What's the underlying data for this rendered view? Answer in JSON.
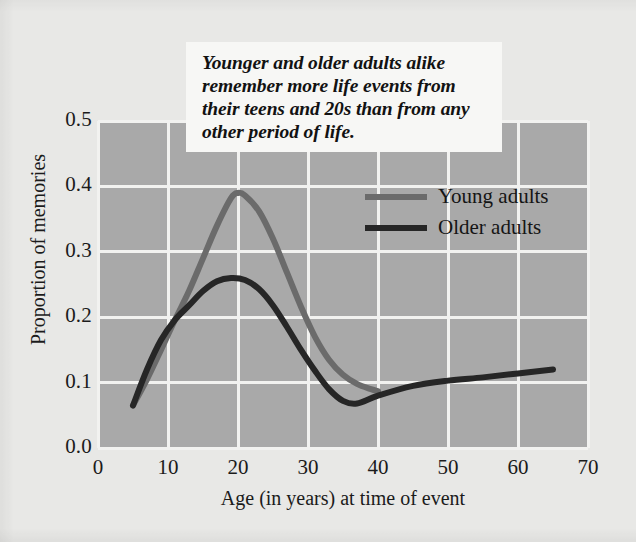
{
  "caption": {
    "text": "Younger and older adults alike remember more life events from their teens and 20s than from any other period of life."
  },
  "colors": {
    "background": "#e8e8e6",
    "plot_background": "#a9a9a9",
    "gridline": "#f2f2f0",
    "young_adults": "#6b6b6b",
    "older_adults": "#262626",
    "caption_background": "#f7f7f5",
    "text": "#1b1b1b"
  },
  "chart_data": {
    "type": "line",
    "title": "",
    "xlabel": "Age (in years) at time of event",
    "ylabel": "Proportion of memories",
    "xlim": [
      0,
      70
    ],
    "ylim": [
      0.0,
      0.5
    ],
    "xticks": [
      0,
      10,
      20,
      30,
      40,
      50,
      60,
      70
    ],
    "xtick_labels": [
      "0",
      "10",
      "20",
      "30",
      "40",
      "50",
      "60",
      "70"
    ],
    "yticks": [
      0.0,
      0.1,
      0.2,
      0.3,
      0.4,
      0.5
    ],
    "ytick_labels": [
      "0.0",
      "0.1",
      "0.2",
      "0.3",
      "0.4",
      "0.5"
    ],
    "grid": true,
    "legend_position": "upper right",
    "series": [
      {
        "name": "Young adults",
        "color": "#6b6b6b",
        "x": [
          5,
          7,
          9,
          11,
          13,
          15,
          17,
          19,
          20,
          21,
          23,
          25,
          27,
          29,
          31,
          33,
          35,
          37,
          39,
          40
        ],
        "y": [
          0.065,
          0.105,
          0.15,
          0.196,
          0.24,
          0.29,
          0.34,
          0.382,
          0.39,
          0.386,
          0.362,
          0.32,
          0.268,
          0.216,
          0.17,
          0.135,
          0.112,
          0.098,
          0.09,
          0.087
        ]
      },
      {
        "name": "Older adults",
        "color": "#262626",
        "x": [
          5,
          7,
          9,
          11,
          13,
          15,
          17,
          19,
          21,
          23,
          25,
          27,
          29,
          31,
          33,
          35,
          37,
          40,
          45,
          50,
          55,
          60,
          65
        ],
        "y": [
          0.065,
          0.12,
          0.165,
          0.196,
          0.218,
          0.24,
          0.255,
          0.26,
          0.257,
          0.243,
          0.218,
          0.185,
          0.15,
          0.118,
          0.09,
          0.072,
          0.068,
          0.08,
          0.095,
          0.103,
          0.108,
          0.114,
          0.12
        ]
      }
    ]
  },
  "legend": {
    "items": [
      {
        "label": "Young adults",
        "color": "#6b6b6b"
      },
      {
        "label": "Older adults",
        "color": "#262626"
      }
    ]
  }
}
